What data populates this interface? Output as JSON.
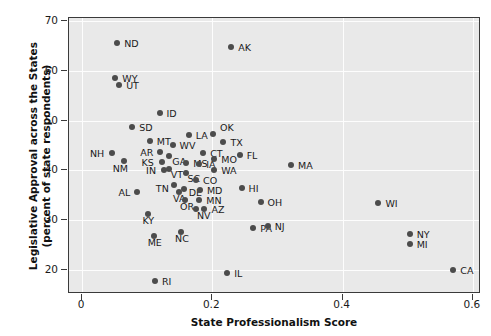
{
  "chart_data": {
    "type": "scatter",
    "title": "",
    "xlabel": "State Professionalism Score",
    "ylabel": "Legislative Approval across the States\n(percent of state respondents)",
    "ylabel_line1": "Legislative Approval across the States",
    "ylabel_line2": "(percent of state respondents)",
    "xlim": [
      -0.02,
      0.6125
    ],
    "ylim": [
      15.2,
      70.6
    ],
    "xticks": [
      0,
      0.2,
      0.4,
      0.6
    ],
    "xticklabels": [
      "0",
      "0.2",
      "0.4",
      "0.6"
    ],
    "yticks": [
      20,
      30,
      40,
      50,
      60,
      70
    ],
    "yticklabels": [
      "20",
      "30",
      "40",
      "50",
      "60",
      "70"
    ],
    "grid": true,
    "grid_color": "#fdfdfd",
    "panel_background": "#e9e9e9",
    "marker_color": "#4c4c4c",
    "legend": null,
    "points": [
      {
        "label": "ND",
        "x": 0.054,
        "y": 65.6,
        "lx": 7,
        "ly": -4
      },
      {
        "label": "AK",
        "x": 0.229,
        "y": 64.7,
        "lx": 7,
        "ly": -4
      },
      {
        "label": "WY",
        "x": 0.051,
        "y": 58.6,
        "lx": 7,
        "ly": -4
      },
      {
        "label": "UT",
        "x": 0.057,
        "y": 57.1,
        "lx": 7,
        "ly": -4
      },
      {
        "label": "ID",
        "x": 0.119,
        "y": 51.5,
        "lx": 7,
        "ly": -4
      },
      {
        "label": "SD",
        "x": 0.077,
        "y": 48.8,
        "lx": 7,
        "ly": -4
      },
      {
        "label": "LA",
        "x": 0.164,
        "y": 47.1,
        "lx": 7,
        "ly": -4
      },
      {
        "label": "OK",
        "x": 0.201,
        "y": 47.4,
        "lx": 7,
        "ly": -11
      },
      {
        "label": "MT",
        "x": 0.104,
        "y": 46.0,
        "lx": 7,
        "ly": -4
      },
      {
        "label": "TX",
        "x": 0.217,
        "y": 45.7,
        "lx": 7,
        "ly": -4
      },
      {
        "label": "WV",
        "x": 0.139,
        "y": 45.1,
        "lx": 7,
        "ly": -4
      },
      {
        "label": "AR",
        "x": 0.12,
        "y": 43.7,
        "lx": -20,
        "ly": -4
      },
      {
        "label": "CT",
        "x": 0.186,
        "y": 43.5,
        "lx": 7,
        "ly": -4
      },
      {
        "label": "NH",
        "x": 0.046,
        "y": 43.5,
        "lx": -22,
        "ly": -4
      },
      {
        "label": "FL",
        "x": 0.242,
        "y": 43.1,
        "lx": 7,
        "ly": -4
      },
      {
        "label": "GA",
        "x": 0.134,
        "y": 43.0,
        "lx": 3,
        "ly": 1
      },
      {
        "label": "NM",
        "x": 0.064,
        "y": 41.9,
        "lx": -11,
        "ly": 3
      },
      {
        "label": "KS",
        "x": 0.122,
        "y": 41.7,
        "lx": -20,
        "ly": -4
      },
      {
        "label": "MS",
        "x": 0.16,
        "y": 41.5,
        "lx": 7,
        "ly": -4
      },
      {
        "label": "IA",
        "x": 0.18,
        "y": 41.3,
        "lx": 7,
        "ly": -4
      },
      {
        "label": "MO",
        "x": 0.203,
        "y": 42.2,
        "lx": 7,
        "ly": -4
      },
      {
        "label": "MA",
        "x": 0.321,
        "y": 41.0,
        "lx": 7,
        "ly": -4
      },
      {
        "label": "WA",
        "x": 0.203,
        "y": 40.0,
        "lx": 7,
        "ly": -4
      },
      {
        "label": "IN",
        "x": 0.126,
        "y": 40.0,
        "lx": -18,
        "ly": -4
      },
      {
        "label": "VT",
        "x": 0.133,
        "y": 40.3,
        "lx": 2,
        "ly": 1
      },
      {
        "label": "SC",
        "x": 0.159,
        "y": 39.5,
        "lx": 2,
        "ly": 1
      },
      {
        "label": "CO",
        "x": 0.175,
        "y": 38.0,
        "lx": 7,
        "ly": -4
      },
      {
        "label": "HI",
        "x": 0.245,
        "y": 36.4,
        "lx": 7,
        "ly": -4
      },
      {
        "label": "TN",
        "x": 0.141,
        "y": 37.0,
        "lx": -18,
        "ly": -1
      },
      {
        "label": "DE",
        "x": 0.156,
        "y": 36.2,
        "lx": 5,
        "ly": -1
      },
      {
        "label": "MD",
        "x": 0.181,
        "y": 36.1,
        "lx": 7,
        "ly": -4
      },
      {
        "label": "AL",
        "x": 0.085,
        "y": 35.6,
        "lx": -19,
        "ly": -4
      },
      {
        "label": "VA",
        "x": 0.149,
        "y": 35.7,
        "lx": -6,
        "ly": 2
      },
      {
        "label": "OH",
        "x": 0.274,
        "y": 33.6,
        "lx": 7,
        "ly": -4
      },
      {
        "label": "WI",
        "x": 0.455,
        "y": 33.5,
        "lx": 7,
        "ly": -4
      },
      {
        "label": "OR",
        "x": 0.158,
        "y": 34.1,
        "lx": -5,
        "ly": 2
      },
      {
        "label": "MN",
        "x": 0.18,
        "y": 34.0,
        "lx": 7,
        "ly": -4
      },
      {
        "label": "AZ",
        "x": 0.188,
        "y": 32.2,
        "lx": 7,
        "ly": -4
      },
      {
        "label": "NV",
        "x": 0.175,
        "y": 32.2,
        "lx": 1,
        "ly": 2
      },
      {
        "label": "KY",
        "x": 0.102,
        "y": 31.3,
        "lx": -6,
        "ly": 2
      },
      {
        "label": "PA",
        "x": 0.263,
        "y": 28.4,
        "lx": 7,
        "ly": -4
      },
      {
        "label": "NJ",
        "x": 0.285,
        "y": 28.9,
        "lx": 7,
        "ly": -4
      },
      {
        "label": "NY",
        "x": 0.503,
        "y": 27.3,
        "lx": 7,
        "ly": -4
      },
      {
        "label": "NC",
        "x": 0.152,
        "y": 27.6,
        "lx": -6,
        "ly": 2
      },
      {
        "label": "MI",
        "x": 0.503,
        "y": 25.2,
        "lx": 7,
        "ly": -4
      },
      {
        "label": "ME",
        "x": 0.11,
        "y": 26.8,
        "lx": -6,
        "ly": 2
      },
      {
        "label": "CA",
        "x": 0.57,
        "y": 20.0,
        "lx": 7,
        "ly": -4
      },
      {
        "label": "IL",
        "x": 0.223,
        "y": 19.4,
        "lx": 7,
        "ly": -4
      },
      {
        "label": "RI",
        "x": 0.112,
        "y": 17.8,
        "lx": 7,
        "ly": -4
      }
    ]
  }
}
